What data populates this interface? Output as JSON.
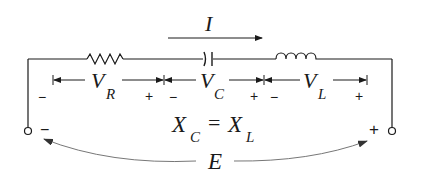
{
  "diagram": {
    "type": "series RLC circuit at resonance",
    "current": {
      "symbol": "I"
    },
    "components": [
      {
        "id": "resistor",
        "kind": "resistor",
        "voltage_symbol": "V",
        "voltage_subscript": "R",
        "neg_sign": "−",
        "pos_sign": "+"
      },
      {
        "id": "capacitor",
        "kind": "capacitor",
        "voltage_symbol": "V",
        "voltage_subscript": "C",
        "neg_sign": "−",
        "pos_sign": "+"
      },
      {
        "id": "inductor",
        "kind": "inductor",
        "voltage_symbol": "V",
        "voltage_subscript": "L",
        "neg_sign": "−",
        "pos_sign": "+"
      }
    ],
    "condition": {
      "left": "X",
      "left_sub": "C",
      "equals": "=",
      "right": "X",
      "right_sub": "L"
    },
    "source": {
      "symbol": "E",
      "neg_terminal_sign": "−",
      "pos_terminal_sign": "+"
    },
    "colors": {
      "line": "#1a1a1a",
      "arc": "#7a7a7a",
      "background": "#ffffff"
    }
  }
}
